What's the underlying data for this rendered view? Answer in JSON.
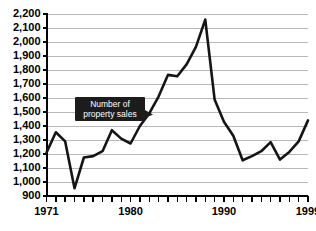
{
  "chart_data": {
    "type": "line",
    "title": "",
    "subtitle": "",
    "xlabel": "",
    "ylabel": "",
    "xlim": [
      1971,
      1999
    ],
    "ylim": [
      900,
      2200
    ],
    "grid": true,
    "legend_position": "none",
    "y_ticks": [
      900,
      1000,
      1100,
      1200,
      1300,
      1400,
      1500,
      1600,
      1700,
      1800,
      1900,
      2000,
      2100,
      2200
    ],
    "y_tick_labels": [
      "900",
      "1,000",
      "1,100",
      "1,200",
      "1,300",
      "1,400",
      "1,500",
      "1,600",
      "1,700",
      "1,800",
      "1,900",
      "2,000",
      "2,100",
      "2,200"
    ],
    "x_ticks": [
      1971,
      1972,
      1973,
      1974,
      1975,
      1976,
      1977,
      1978,
      1979,
      1980,
      1981,
      1982,
      1983,
      1984,
      1985,
      1986,
      1987,
      1988,
      1989,
      1990,
      1991,
      1992,
      1993,
      1994,
      1995,
      1996,
      1997,
      1998,
      1999
    ],
    "x_tick_labels": [
      "1971",
      "1980",
      "1990",
      "1999"
    ],
    "x_labeled_ticks": [
      1971,
      1980,
      1990,
      1999
    ],
    "series": [
      {
        "name": "Number of property sales",
        "color": "#151515",
        "x": [
          1971,
          1972,
          1973,
          1974,
          1975,
          1976,
          1977,
          1978,
          1979,
          1980,
          1981,
          1982,
          1983,
          1984,
          1985,
          1986,
          1987,
          1988,
          1989,
          1990,
          1991,
          1992,
          1993,
          1994,
          1995,
          1996,
          1997,
          1998,
          1999
        ],
        "values": [
          1210,
          1355,
          1290,
          955,
          1175,
          1185,
          1220,
          1370,
          1310,
          1275,
          1400,
          1490,
          1610,
          1765,
          1755,
          1840,
          1965,
          2160,
          1590,
          1430,
          1330,
          1155,
          1185,
          1220,
          1285,
          1160,
          1215,
          1290,
          1440
        ]
      }
    ],
    "annotations": [
      {
        "name": "number-of-property-sales-callout",
        "line1": "Number of",
        "line2": "property sales",
        "target_x": 1981,
        "target_y": 1525
      }
    ]
  }
}
